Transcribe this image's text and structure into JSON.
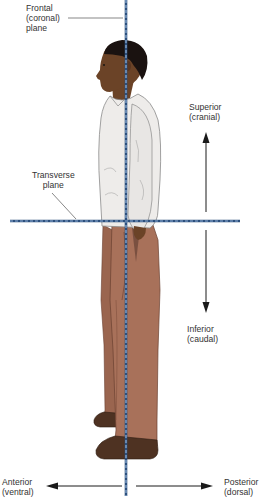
{
  "diagram": {
    "labels": {
      "frontal": {
        "line1": "Frontal",
        "line2": "(coronal)",
        "line3": "plane"
      },
      "transverse": {
        "line1": "Transverse",
        "line2": "plane"
      },
      "superior": {
        "line1": "Superior",
        "line2": "(cranial)"
      },
      "inferior": {
        "line1": "Inferior",
        "line2": "(caudal)"
      },
      "anterior": {
        "line1": "Anterior",
        "line2": "(ventral)"
      },
      "posterior": {
        "line1": "Posterior",
        "line2": "(dorsal)"
      }
    },
    "figure": {
      "subject": "standing-man-side-view",
      "facing": "left"
    },
    "colors": {
      "plane_line": "#2c4f7c",
      "plane_dash": "#8fb0d6",
      "arrow": "#1a1a1a",
      "leader_line": "#555555",
      "skin": "#6b4327",
      "hair": "#1a1210",
      "shirt": "#eeecea",
      "shirt_outline": "#8a8a8a",
      "pants": "#a8715a",
      "pants_shadow": "#8a5a45",
      "shoe": "#4e3222",
      "text": "#333333"
    }
  }
}
